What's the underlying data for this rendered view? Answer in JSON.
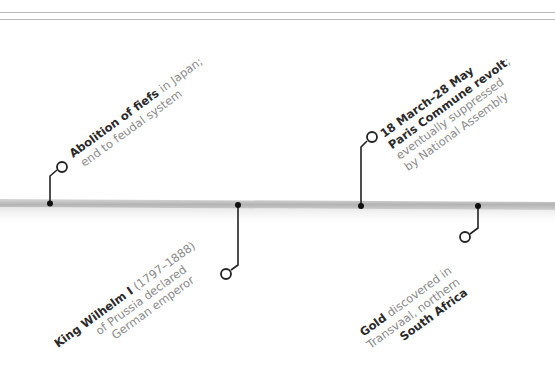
{
  "diagram": {
    "type": "timeline",
    "colors": {
      "rule": "#b9b9b9",
      "bar": "#bdbdbd",
      "connector": "#222222",
      "text_bold": "#2a2a2a",
      "text_regular": "#8a8a8a"
    },
    "events": [
      {
        "id": "abolition-of-fiefs",
        "position": "above",
        "lines": [
          {
            "bold": "Abolition of fiefs",
            "text": " in Japan;"
          },
          {
            "bold": "",
            "text": "end to feudal system"
          }
        ]
      },
      {
        "id": "king-wilhelm",
        "position": "below",
        "lines": [
          {
            "bold": "King Wilhelm I",
            "text": " (1797–1888)"
          },
          {
            "bold": "",
            "text": "of Prussia declared"
          },
          {
            "bold": "",
            "text": "German emperor"
          }
        ]
      },
      {
        "id": "paris-commune",
        "position": "above",
        "lines": [
          {
            "bold": "18 March–28 May",
            "text": ""
          },
          {
            "bold": "Paris Commune revolt",
            "text": ";"
          },
          {
            "bold": "",
            "text": "eventually suppressed"
          },
          {
            "bold": "",
            "text": "by National Assembly"
          }
        ]
      },
      {
        "id": "gold-discovered",
        "position": "below",
        "lines": [
          {
            "bold": "Gold",
            "text": " discovered in"
          },
          {
            "bold": "",
            "text": "Transvaal, northern"
          },
          {
            "bold": "South Africa",
            "text": ""
          }
        ]
      }
    ]
  }
}
